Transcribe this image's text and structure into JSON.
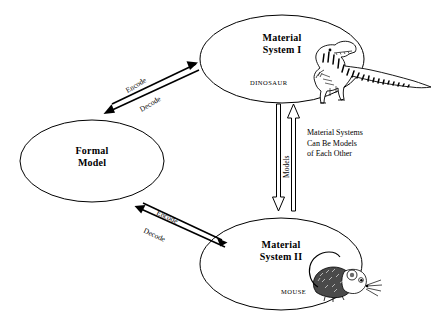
{
  "diagram": {
    "nodes": [
      {
        "id": "material-system-1",
        "line1": "Material",
        "line2": "System I",
        "species": "DINOSAUR",
        "species_icon": "dinosaur-illustration"
      },
      {
        "id": "formal-model",
        "line1": "Formal",
        "line2": "Model",
        "species": "",
        "species_icon": ""
      },
      {
        "id": "material-system-2",
        "line1": "Material",
        "line2": "System II",
        "species": "MOUSE",
        "species_icon": "mouse-illustration"
      }
    ],
    "edges": {
      "upper_encode": "Encode",
      "upper_decode": "Decode",
      "lower_encode": "Encode",
      "lower_decode": "Decode",
      "models": "Models"
    },
    "annotation": {
      "line1": "Material Systems",
      "line2": "Can Be Models",
      "line3": "of Each Other"
    },
    "colors": {
      "stroke": "#000000",
      "background": "#ffffff",
      "arrow_outline": "#000000"
    }
  }
}
